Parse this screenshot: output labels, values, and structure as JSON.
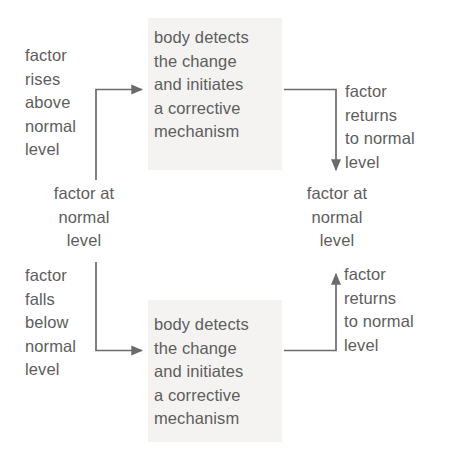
{
  "diagram": {
    "type": "flow-diagram",
    "text_color": "#5d5d5d",
    "line_color": "#6b6b6b",
    "panel_color": "#f4f3f1",
    "background_color": "#ffffff",
    "nodes": {
      "factor_rises": "factor\nrises\nabove\nnormal\nlevel",
      "factor_at_normal_left": "factor at\nnormal\nlevel",
      "factor_falls": "factor\nfalls\nbelow\nnormal\nlevel",
      "body_detects_top": "body detects\nthe change\nand initiates\na corrective\nmechanism",
      "body_detects_bottom": "body detects\nthe change\nand initiates\na corrective\nmechanism",
      "factor_returns_top": "factor\nreturns\nto normal\nlevel",
      "factor_at_normal_right": "factor at\nnormal\nlevel",
      "factor_returns_bottom": "factor\nreturns\nto normal\nlevel"
    },
    "connectors": [
      {
        "name": "rise-to-detect",
        "from": "factor_at_normal_left",
        "to": "body_detects_top",
        "shape": "elbow-up-right",
        "arrow": "right"
      },
      {
        "name": "detect-to-normal-top",
        "from": "body_detects_top",
        "to": "factor_at_normal_right",
        "shape": "elbow-right-down",
        "arrow": "down"
      },
      {
        "name": "fall-to-detect",
        "from": "factor_at_normal_left",
        "to": "body_detects_bottom",
        "shape": "elbow-down-right",
        "arrow": "right"
      },
      {
        "name": "detect-to-normal-bottom",
        "from": "body_detects_bottom",
        "to": "factor_at_normal_right",
        "shape": "elbow-right-up",
        "arrow": "up"
      }
    ]
  }
}
